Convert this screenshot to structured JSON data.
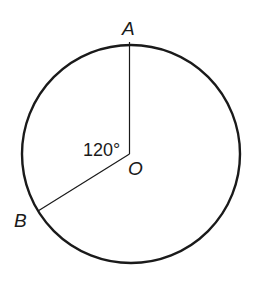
{
  "diagram": {
    "type": "circle-central-angle",
    "points": {
      "A": {
        "label": "A"
      },
      "B": {
        "label": "B"
      },
      "O": {
        "label": "O"
      }
    },
    "angle": {
      "vertex": "O",
      "between": [
        "A",
        "B"
      ],
      "label": "120°"
    },
    "colors": {
      "stroke": "#1a1a1a",
      "background": "#ffffff"
    }
  }
}
